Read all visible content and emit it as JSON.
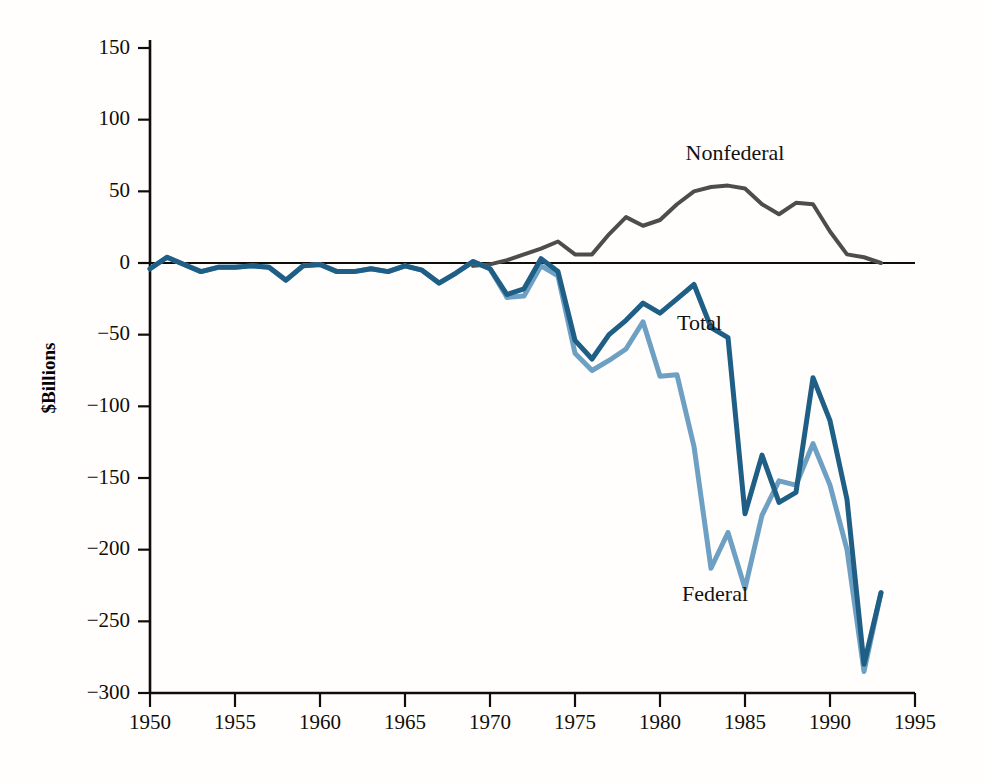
{
  "chart_data": {
    "type": "line",
    "title": "",
    "subtitle": "",
    "xlabel": "",
    "ylabel": "$Billions",
    "xlim": [
      1950,
      1995
    ],
    "ylim": [
      -300,
      150
    ],
    "grid": false,
    "legend_position": "inline-annotations",
    "x_ticks": [
      "1950",
      "1955",
      "1960",
      "1965",
      "1970",
      "1975",
      "1980",
      "1985",
      "1990",
      "1995"
    ],
    "y_ticks": [
      "150",
      "100",
      "50",
      "0",
      "−50",
      "−100",
      "−150",
      "−200",
      "−250",
      "−300"
    ],
    "zero_line": 0,
    "annotations": [
      {
        "name": "nonfederal-label",
        "text": "Nonfederal",
        "x": 1981.5,
        "y": 72
      },
      {
        "name": "total-label",
        "text": "Total",
        "x": 1981.0,
        "y": -47
      },
      {
        "name": "federal-label",
        "text": "Federal",
        "x": 1981.3,
        "y": -236
      }
    ],
    "x": [
      1950,
      1951,
      1952,
      1953,
      1954,
      1955,
      1956,
      1957,
      1958,
      1959,
      1960,
      1961,
      1962,
      1963,
      1964,
      1965,
      1966,
      1967,
      1968,
      1969,
      1970,
      1971,
      1972,
      1973,
      1974,
      1975,
      1976,
      1977,
      1978,
      1979,
      1980,
      1981,
      1982,
      1983,
      1984,
      1985,
      1986,
      1987,
      1988,
      1989,
      1990,
      1991,
      1992,
      1993
    ],
    "series": [
      {
        "name": "Total",
        "color": "#1f5f86",
        "width": 5,
        "values": [
          -4,
          4,
          -1,
          -6,
          -3,
          -3,
          -2,
          -3,
          -12,
          -2,
          -1,
          -6,
          -6,
          -4,
          -6,
          -2,
          -5,
          -14,
          -7,
          1,
          -4,
          -22,
          -18,
          3,
          -6,
          -54,
          -67,
          -50,
          -40,
          -28,
          -35,
          -25,
          -15,
          -45,
          -52,
          -175,
          -134,
          -167,
          -160,
          -80,
          -110,
          -165,
          -280,
          -230
        ]
      },
      {
        "name": "Federal",
        "color": "#6ea0c4",
        "width": 5,
        "values": [
          -4,
          4,
          -1,
          -6,
          -3,
          -3,
          -2,
          -3,
          -12,
          -2,
          -1,
          -6,
          -6,
          -4,
          -6,
          -2,
          -5,
          -14,
          -7,
          1,
          -4,
          -24,
          -23,
          -2,
          -9,
          -63,
          -75,
          -68,
          -60,
          -41,
          -79,
          -78,
          -128,
          -213,
          -188,
          -227,
          -176,
          -152,
          -155,
          -126,
          -155,
          -200,
          -285,
          -230
        ]
      },
      {
        "name": "Nonfederal",
        "color": "#4d4d4d",
        "width": 4,
        "values": [
          0,
          0,
          0,
          0,
          0,
          0,
          0,
          0,
          0,
          0,
          0,
          0,
          0,
          0,
          0,
          0,
          0,
          0,
          0,
          0,
          0,
          2,
          5,
          5,
          3,
          9,
          8,
          18,
          20,
          13,
          44,
          53,
          113,
          168,
          136,
          52,
          42,
          -15,
          -5,
          46,
          45,
          35,
          5,
          0
        ]
      }
    ]
  },
  "nonfederal_overlay": {
    "note": "Nonfederal drawn only from 1969 onward in the figure",
    "x": [
      1969,
      1970,
      1971,
      1972,
      1973,
      1974,
      1975,
      1976,
      1977,
      1978,
      1979,
      1980,
      1981,
      1982,
      1983,
      1984,
      1985,
      1986,
      1987,
      1988,
      1989,
      1990,
      1991,
      1992,
      1993
    ],
    "values": [
      -2,
      -1,
      2,
      6,
      10,
      15,
      6,
      6,
      20,
      32,
      26,
      30,
      41,
      50,
      53,
      54,
      52,
      41,
      34,
      42,
      41,
      22,
      6,
      4,
      0
    ]
  },
  "axis_geometry": {
    "plot_left": 150,
    "plot_right": 915,
    "plot_top": 48,
    "plot_bottom": 693,
    "zero_y": 263
  }
}
